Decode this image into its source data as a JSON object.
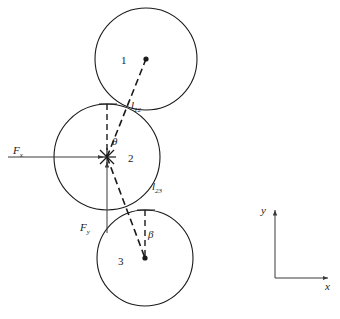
{
  "figure": {
    "stroke_color": "#1a1a1a",
    "background": "#ffffff"
  },
  "bodies": [
    {
      "id": "body-1",
      "label": "1",
      "cx": 146,
      "cy": 59,
      "r": 51,
      "label_x": 121,
      "label_y": 55
    },
    {
      "id": "body-2",
      "label": "2",
      "cx": 107,
      "cy": 157,
      "r": 53,
      "label_x": 128,
      "label_y": 153
    },
    {
      "id": "body-3",
      "label": "3",
      "cx": 145,
      "cy": 258,
      "r": 48,
      "label_x": 118,
      "label_y": 256
    }
  ],
  "contacts": [
    {
      "id": "contact-12",
      "label": "l",
      "subscript": "12",
      "x": 128,
      "y": 106,
      "label_x": 131,
      "label_y": 100
    },
    {
      "id": "contact-23",
      "label": "l",
      "subscript": "23",
      "x": 140,
      "y": 202,
      "label_x": 152,
      "label_y": 181
    }
  ],
  "angles": [
    {
      "id": "angle-theta",
      "label": "θ",
      "label_x": 112,
      "label_y": 136
    },
    {
      "id": "angle-beta",
      "label": "β",
      "label_x": 148,
      "label_y": 229
    }
  ],
  "forces": [
    {
      "id": "force-fx",
      "label": "F",
      "subscript": "x",
      "label_x": 13,
      "label_y": 145,
      "direction": "right",
      "from_x": 8,
      "from_y": 157,
      "to_x": 105,
      "to_y": 157
    },
    {
      "id": "force-fy",
      "label": "F",
      "subscript": "y",
      "label_x": 80,
      "label_y": 222,
      "direction": "up",
      "from_x": 107,
      "from_y": 233,
      "to_x": 107,
      "to_y": 160
    }
  ],
  "axes": {
    "origin_x": 275,
    "origin_y": 278,
    "x_end": 330,
    "y_end": 208,
    "x_label": "x",
    "y_label": "y",
    "x_label_x": 325,
    "x_label_y": 283,
    "y_label_x": 261,
    "y_label_y": 205
  }
}
